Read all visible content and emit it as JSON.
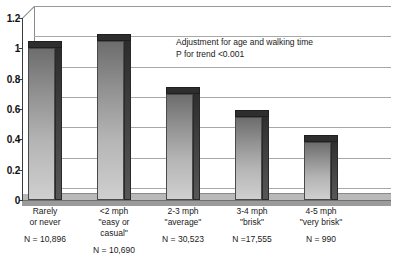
{
  "chart_data": {
    "type": "bar",
    "title": "",
    "xlabel": "",
    "ylabel": "",
    "ylim": [
      0,
      1.2
    ],
    "grid": true,
    "legend": "none",
    "categories": [
      "Rarely or never",
      "<2 mph \"easy or casual\"",
      "2-3 mph \"average\"",
      "3-4 mph \"brisk\"",
      "4-5 mph \"very brisk\""
    ],
    "values": [
      1.0,
      1.05,
      0.7,
      0.55,
      0.38
    ],
    "yticks": [
      0,
      0.2,
      0.4,
      0.6,
      0.8,
      1,
      1.2
    ],
    "ytick_labels": [
      "0",
      "0.2",
      "0.4",
      "0.6",
      "0.8",
      "1",
      "1.2"
    ],
    "sample_sizes": [
      10896,
      10690,
      30523,
      17555,
      990
    ],
    "annotations": [
      "Adjustment for age and walking time",
      "P for trend <0.001"
    ]
  },
  "axis": {
    "ticks": [
      {
        "label": "1.2",
        "value": 1.2
      },
      {
        "label": "1",
        "value": 1.0
      },
      {
        "label": "0.8",
        "value": 0.8
      },
      {
        "label": "0.6",
        "value": 0.6
      },
      {
        "label": "0.4",
        "value": 0.4
      },
      {
        "label": "0.2",
        "value": 0.2
      },
      {
        "label": "0",
        "value": 0.0
      }
    ]
  },
  "annotation": {
    "line1": "Adjustment for age and walking time",
    "line2": "P for trend <0.001"
  },
  "categories": [
    {
      "line1": "Rarely",
      "line2": "or never",
      "line3": "",
      "n": "N = 10,896"
    },
    {
      "line1": "<2 mph",
      "line2": "\"easy or",
      "line3": "casual\"",
      "n": "N = 10,690"
    },
    {
      "line1": "2-3 mph",
      "line2": "\"average\"",
      "line3": "",
      "n": "N = 30,523"
    },
    {
      "line1": "3-4 mph",
      "line2": "\"brisk\"",
      "line3": "",
      "n": "N =17,555"
    },
    {
      "line1": "4-5 mph",
      "line2": "\"very brisk\"",
      "line3": "",
      "n": "N = 990"
    }
  ],
  "colors": {
    "bar_front_top": "#6d6d6d",
    "bar_front_bottom": "#cfcfcf",
    "bar_side": "#2e2e2e",
    "gridline": "#9a9a9a",
    "axis": "#3b3b3b",
    "text": "#1a1a1a"
  }
}
